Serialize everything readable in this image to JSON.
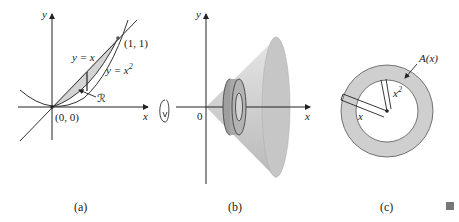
{
  "figure": {
    "panels": [
      {
        "id": "a",
        "caption": "(a)",
        "axis_labels": {
          "x": "x",
          "y": "y"
        },
        "curves": [
          {
            "label": "y = x"
          },
          {
            "label_prefix": "y = x",
            "label_sup": "2"
          }
        ],
        "points": [
          {
            "label": "(0, 0)"
          },
          {
            "label": "(1, 1)"
          }
        ],
        "region_label": "ℛ"
      },
      {
        "id": "b",
        "caption": "(b)",
        "axis_labels": {
          "x": "x",
          "y": "y"
        },
        "origin_label": "0",
        "description": "Solid of revolution about x-axis with washer cross-section"
      },
      {
        "id": "c",
        "caption": "(c)",
        "area_label": "A(x)",
        "outer_radius_label": "x",
        "inner_radius_label_prefix": "x",
        "inner_radius_label_sup": "2"
      }
    ],
    "colors": {
      "shade": "#d4d4d4",
      "cone": "#c8c8c8",
      "ring": "#bdbdbd",
      "line": "#222222"
    }
  }
}
